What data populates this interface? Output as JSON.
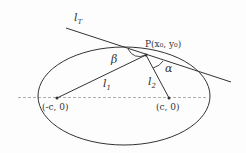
{
  "diagram": {
    "type": "ellipse-reflection-property",
    "labels": {
      "tangent_line": "l",
      "tangent_sub": "T",
      "point": "P(x₀, y₀)",
      "angle_beta": "β",
      "angle_alpha": "α",
      "line1": "l",
      "line1_sub": "1",
      "line2": "l",
      "line2_sub": "2",
      "focus_left": "(-c, 0)",
      "focus_right": "(c, 0)"
    },
    "colors": {
      "stroke": "#333333",
      "axis": "#888888"
    }
  }
}
